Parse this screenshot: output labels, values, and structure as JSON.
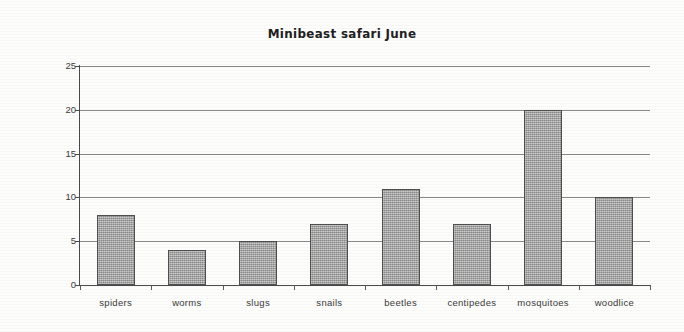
{
  "chart_data": {
    "type": "bar",
    "title": "Minibeast safari June",
    "xlabel": "",
    "ylabel": "Number found",
    "categories": [
      "spiders",
      "worms",
      "slugs",
      "snails",
      "beetles",
      "centipedes",
      "mosquitoes",
      "woodlice"
    ],
    "values": [
      8,
      4,
      5,
      7,
      11,
      7,
      20,
      10
    ],
    "ylim": [
      0,
      25
    ],
    "ytick_labels": [
      "0",
      "5",
      "10",
      "15",
      "20",
      "25"
    ],
    "ytick_values": [
      0,
      5,
      10,
      15,
      20,
      25
    ],
    "grid": true,
    "legend": false,
    "bar_color": "#9a9a9a",
    "bar_edge_color": "#4f4f4f",
    "gridline_color": "#8a8a8a",
    "axis_color": "#4a4a4a",
    "background_color": "#ffffff"
  }
}
